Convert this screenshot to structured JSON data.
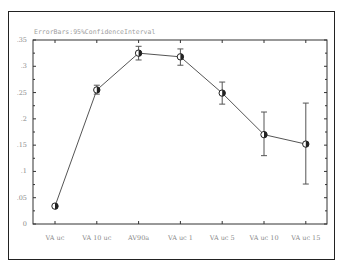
{
  "chart_data": {
    "type": "line",
    "title": "ErrorBars:95%ConfidenceInterval",
    "xlabel": "",
    "ylabel": "",
    "ylim": [
      0,
      0.35
    ],
    "yticks": [
      0,
      0.05,
      0.1,
      0.15,
      0.2,
      0.25,
      0.3,
      0.35
    ],
    "ytick_labels": [
      "0",
      ".05",
      ".1",
      ".15",
      ".2",
      ".25",
      ".3",
      ".35"
    ],
    "grid": false,
    "legend": null,
    "categories": [
      "VA uc",
      "VA 10 uc",
      "AV90a",
      "VA uc 1",
      "VA uc 5",
      "VA uc 10",
      "VA uc 15"
    ],
    "series": [
      {
        "name": "mean",
        "values": [
          0.034,
          0.255,
          0.325,
          0.318,
          0.249,
          0.17,
          0.152
        ],
        "error_low": [
          0.034,
          0.247,
          0.312,
          0.302,
          0.228,
          0.13,
          0.076
        ],
        "error_high": [
          0.034,
          0.264,
          0.338,
          0.333,
          0.27,
          0.213,
          0.23
        ]
      }
    ]
  },
  "style": {
    "line_color": "#555555",
    "axis_color": "#333333",
    "label_color": "#8a8a8a"
  }
}
